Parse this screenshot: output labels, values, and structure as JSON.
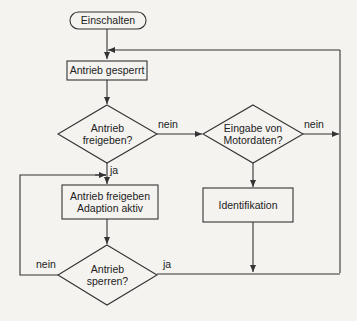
{
  "diagram": {
    "type": "flowchart",
    "colors": {
      "background": "#f4f3f0",
      "stroke": "#333333",
      "text": "#222222"
    },
    "nodes": {
      "start": {
        "shape": "terminator",
        "label": "Einschalten"
      },
      "locked": {
        "shape": "process",
        "label": "Antrieb gesperrt"
      },
      "enable_decision": {
        "shape": "decision",
        "line1": "Antrieb",
        "line2": "freigeben?"
      },
      "motordata_decision": {
        "shape": "decision",
        "line1": "Eingabe von",
        "line2": "Motordaten?"
      },
      "identification": {
        "shape": "process",
        "label": "Identifikation"
      },
      "enabled": {
        "shape": "process",
        "line1": "Antrieb freigeben",
        "line2": "Adaption aktiv"
      },
      "lock_decision": {
        "shape": "decision",
        "line1": "Antrieb",
        "line2": "sperren?"
      }
    },
    "edge_labels": {
      "enable_no": "nein",
      "enable_yes": "ja",
      "motordata_no": "nein",
      "lock_no": "nein",
      "lock_yes": "ja"
    },
    "edges": [
      {
        "from": "start",
        "to": "locked"
      },
      {
        "from": "locked",
        "to": "enable_decision"
      },
      {
        "from": "enable_decision",
        "to": "motordata_decision",
        "label": "nein"
      },
      {
        "from": "enable_decision",
        "to": "enabled",
        "label": "ja"
      },
      {
        "from": "motordata_decision",
        "to": "locked",
        "label": "nein"
      },
      {
        "from": "motordata_decision",
        "to": "identification"
      },
      {
        "from": "identification",
        "to": "locked"
      },
      {
        "from": "enabled",
        "to": "lock_decision"
      },
      {
        "from": "lock_decision",
        "to": "enabled",
        "label": "nein"
      },
      {
        "from": "lock_decision",
        "to": "locked",
        "label": "ja"
      }
    ]
  }
}
